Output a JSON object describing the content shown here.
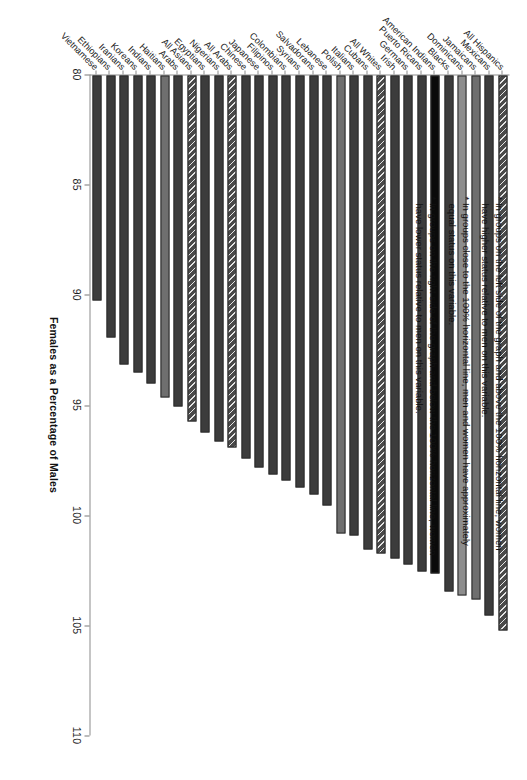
{
  "chart_data": {
    "type": "bar",
    "orientation": "horizontal",
    "title": "",
    "xlabel": "Females as a Percentage of Males",
    "ylabel": "",
    "xlim": [
      80,
      110
    ],
    "xticks": [
      80,
      85,
      90,
      95,
      100,
      105,
      110
    ],
    "grid": false,
    "legend": false,
    "baseline": 80,
    "reference_line": 100,
    "categories": [
      "All Hispanics",
      "Mexicans",
      "Jamaicans",
      "Dominicans",
      "Blacks",
      "American Indians",
      "Puerto Ricans",
      "Germans",
      "Irish",
      "All Whites",
      "Cubans",
      "Italians",
      "Polish",
      "Lebanese",
      "Salvadorans",
      "Syrians",
      "Colombians",
      "Filipinos",
      "Japanese",
      "Chinese",
      "All Arabs",
      "Nigerians",
      "Egyptians",
      "All Asians",
      "Arabs",
      "Haitians",
      "Indians",
      "Koreans",
      "Iranians",
      "Ethiopians",
      "Vietnamese"
    ],
    "values": [
      105.2,
      104.5,
      103.8,
      103.6,
      103.4,
      102.6,
      102.5,
      102.2,
      101.9,
      101.7,
      101.5,
      100.9,
      100.8,
      99.5,
      99.0,
      98.7,
      98.4,
      98.1,
      97.8,
      97.4,
      96.9,
      96.6,
      96.2,
      95.7,
      95.0,
      94.6,
      94.0,
      93.5,
      93.1,
      91.9,
      90.2
    ],
    "fills": [
      "hatch",
      "dark",
      "mid",
      "light",
      "dark",
      "black",
      "dark",
      "dark",
      "dark",
      "hatch",
      "dark",
      "dark",
      "mid",
      "dark",
      "dark",
      "dark",
      "dark",
      "dark",
      "dark",
      "dark",
      "hatch",
      "dark",
      "dark",
      "hatch",
      "dark",
      "mid",
      "dark",
      "dark",
      "dark",
      "dark",
      "dark"
    ]
  },
  "notes": [
    "* In groups on the left side of the graph and above the 100% horizontal line, women have higher status relative to men on this variable.",
    "* In groups close to the 100% horizontal line, men and women have approximately equal status on this variable.",
    "* In groups on the right side of the graph and below the 100% horizontal line, women have lower status relative to men on this variable."
  ]
}
